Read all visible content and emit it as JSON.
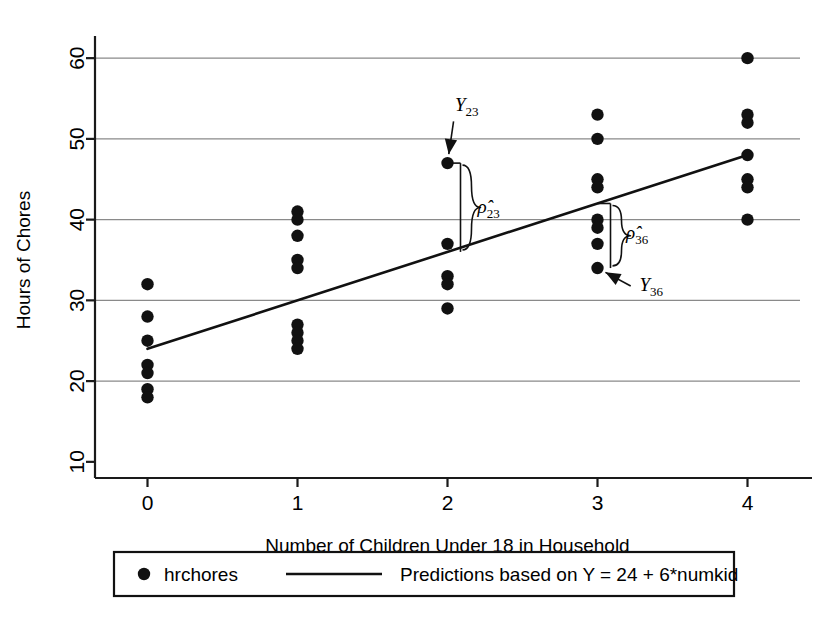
{
  "chart_data": {
    "type": "scatter",
    "title": "",
    "xlabel": "Number of Children Under 18 in Household",
    "ylabel": "Hours of Chores",
    "xlim": [
      -0.35,
      4.35
    ],
    "ylim": [
      8,
      62
    ],
    "x_ticks": [
      "0",
      "1",
      "2",
      "3",
      "4"
    ],
    "x_tick_values": [
      0,
      1,
      2,
      3,
      4
    ],
    "y_ticks": [
      "10",
      "20",
      "30",
      "40",
      "50",
      "60"
    ],
    "y_tick_values": [
      10,
      20,
      30,
      40,
      50,
      60
    ],
    "grid": "horizontal",
    "legend_position": "below-plot",
    "series": [
      {
        "name": "hrchores",
        "marker": "filled-circle",
        "color": "#111111",
        "points": [
          {
            "x": 0,
            "y": 32
          },
          {
            "x": 0,
            "y": 28
          },
          {
            "x": 0,
            "y": 25
          },
          {
            "x": 0,
            "y": 22
          },
          {
            "x": 0,
            "y": 21
          },
          {
            "x": 0,
            "y": 19
          },
          {
            "x": 0,
            "y": 18
          },
          {
            "x": 1,
            "y": 41
          },
          {
            "x": 1,
            "y": 40
          },
          {
            "x": 1,
            "y": 38
          },
          {
            "x": 1,
            "y": 35
          },
          {
            "x": 1,
            "y": 34
          },
          {
            "x": 1,
            "y": 27
          },
          {
            "x": 1,
            "y": 26
          },
          {
            "x": 1,
            "y": 25
          },
          {
            "x": 1,
            "y": 24
          },
          {
            "x": 2,
            "y": 47
          },
          {
            "x": 2,
            "y": 37
          },
          {
            "x": 2,
            "y": 33
          },
          {
            "x": 2,
            "y": 32
          },
          {
            "x": 2,
            "y": 29
          },
          {
            "x": 3,
            "y": 53
          },
          {
            "x": 3,
            "y": 50
          },
          {
            "x": 3,
            "y": 45
          },
          {
            "x": 3,
            "y": 44
          },
          {
            "x": 3,
            "y": 40
          },
          {
            "x": 3,
            "y": 39
          },
          {
            "x": 3,
            "y": 37
          },
          {
            "x": 3,
            "y": 34
          },
          {
            "x": 4,
            "y": 60
          },
          {
            "x": 4,
            "y": 53
          },
          {
            "x": 4,
            "y": 52
          },
          {
            "x": 4,
            "y": 48
          },
          {
            "x": 4,
            "y": 45
          },
          {
            "x": 4,
            "y": 44
          },
          {
            "x": 4,
            "y": 40
          }
        ]
      },
      {
        "name": "Predictions based on Y = 24 + 6*numkid",
        "marker": "line",
        "color": "#111111",
        "intercept": 24,
        "slope": 6,
        "line_points": [
          {
            "x": 0,
            "y": 24
          },
          {
            "x": 4,
            "y": 48
          }
        ]
      }
    ],
    "annotations": [
      {
        "id": "y23",
        "label": "Y",
        "subscript": "23",
        "point": {
          "x": 2,
          "y": 47
        },
        "text_x": 2.05,
        "text_y": 53.4,
        "kind": "arrow-to-point"
      },
      {
        "id": "rho23",
        "label": "ρ̂",
        "subscript": "23",
        "from": {
          "x": 2,
          "y": 47
        },
        "to": {
          "x": 2,
          "y": 36
        },
        "text_x": 2.16,
        "text_y": 41.6,
        "kind": "brace-residual"
      },
      {
        "id": "rho36",
        "label": "ρ̂",
        "subscript": "36",
        "from": {
          "x": 3,
          "y": 42
        },
        "to": {
          "x": 3,
          "y": 34
        },
        "text_x": 3.15,
        "text_y": 38.4,
        "kind": "brace-residual"
      },
      {
        "id": "y36",
        "label": "Y",
        "subscript": "36",
        "point": {
          "x": 3,
          "y": 34
        },
        "text_x": 3.28,
        "text_y": 31.2,
        "kind": "arrow-to-point"
      }
    ]
  },
  "legend": {
    "entries": [
      {
        "label": "hrchores",
        "marker": "filled-circle"
      },
      {
        "label": "Predictions based on Y = 24 + 6*numkid",
        "marker": "line"
      }
    ]
  },
  "colors": {
    "ink": "#111111",
    "grid": "#8a8a8a",
    "background": "#ffffff"
  }
}
